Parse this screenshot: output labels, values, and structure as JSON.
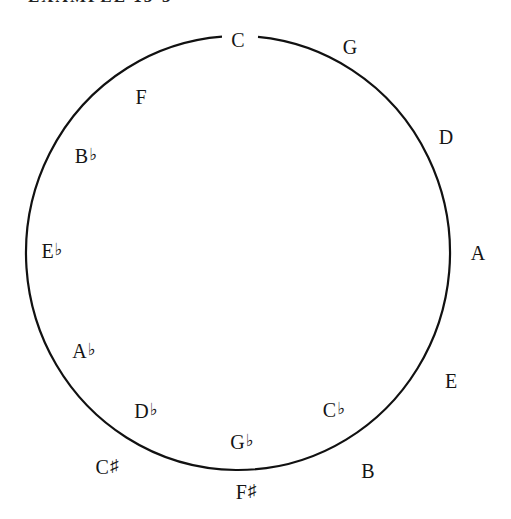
{
  "title": "EXAMPLE 15-3",
  "diagram": {
    "type": "circle-of-fifths",
    "circle": {
      "cx": 238,
      "cy": 253,
      "rx": 212,
      "ry": 217,
      "stroke": "#111111"
    },
    "labels": [
      {
        "id": "C",
        "note": "C",
        "acc": "",
        "x": 238,
        "y": 40
      },
      {
        "id": "G",
        "note": "G",
        "acc": "",
        "x": 350,
        "y": 47
      },
      {
        "id": "D",
        "note": "D",
        "acc": "",
        "x": 446,
        "y": 137
      },
      {
        "id": "A",
        "note": "A",
        "acc": "",
        "x": 478,
        "y": 253
      },
      {
        "id": "E",
        "note": "E",
        "acc": "",
        "x": 451,
        "y": 381
      },
      {
        "id": "B",
        "note": "B",
        "acc": "",
        "x": 368,
        "y": 471
      },
      {
        "id": "Cb",
        "note": "C",
        "acc": "♭",
        "x": 334,
        "y": 411
      },
      {
        "id": "Fs",
        "note": "F",
        "acc": "♯",
        "x": 246,
        "y": 493
      },
      {
        "id": "Gb",
        "note": "G",
        "acc": "♭",
        "x": 242,
        "y": 443
      },
      {
        "id": "Cs",
        "note": "C",
        "acc": "♯",
        "x": 107,
        "y": 468
      },
      {
        "id": "Db",
        "note": "D",
        "acc": "♭",
        "x": 146,
        "y": 412
      },
      {
        "id": "Ab",
        "note": "A",
        "acc": "♭",
        "x": 84,
        "y": 352
      },
      {
        "id": "Eb",
        "note": "E",
        "acc": "♭",
        "x": 52,
        "y": 252
      },
      {
        "id": "Bb",
        "note": "B",
        "acc": "♭",
        "x": 86,
        "y": 157
      },
      {
        "id": "F",
        "note": "F",
        "acc": "",
        "x": 141,
        "y": 97
      }
    ]
  }
}
